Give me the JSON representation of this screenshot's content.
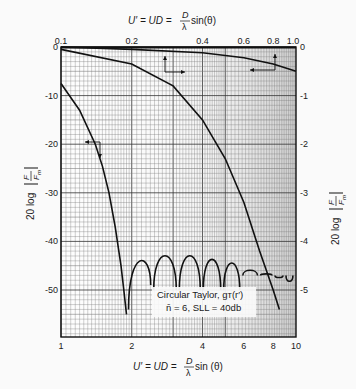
{
  "chart_data": {
    "type": "line",
    "title": "",
    "top_axis": {
      "label": "U' = UD = (D/λ) sin(θ)",
      "ticks": [
        "0.1",
        "0.2",
        "0.4",
        "0.6",
        "0.8",
        "1.0"
      ],
      "values": [
        0.1,
        0.2,
        0.4,
        0.6,
        0.8,
        1.0
      ],
      "scale": "log"
    },
    "bottom_axis": {
      "label": "U' = UD = (D/λ) sin (θ)",
      "ticks": [
        "1",
        "2",
        "4",
        "6",
        "8",
        "10"
      ],
      "values": [
        1,
        2,
        4,
        6,
        8,
        10
      ],
      "scale": "log"
    },
    "left_axis": {
      "label": "20 log |F/Fm|",
      "ticks": [
        "0",
        "-10",
        "-20",
        "-30",
        "-40",
        "-50"
      ],
      "values": [
        0,
        -10,
        -20,
        -30,
        -40,
        -50
      ],
      "ylim": [
        -55,
        0
      ]
    },
    "right_axis": {
      "label": "20 log |F/Fm|",
      "ticks": [
        "0",
        "-1",
        "-2",
        "-3",
        "-4",
        "-5"
      ],
      "values": [
        0,
        -1,
        -2,
        -3,
        -4,
        -5
      ],
      "ylim": [
        -5.5,
        0
      ]
    },
    "annotation": {
      "line1": "Circular Taylor, gT(r')",
      "line2": "n̄ = 6, SLL = 40db"
    },
    "series": [
      {
        "name": "Main pattern (bottom x, left y)",
        "x": [
          1.0,
          1.2,
          1.4,
          1.5,
          1.6,
          1.7,
          1.8,
          1.85,
          1.9
        ],
        "y": [
          -7.5,
          -13,
          -20,
          -24.5,
          -30,
          -37,
          -45,
          -50,
          -55
        ]
      },
      {
        "name": "Sidelobes (bottom x, left y)",
        "peaks_x": [
          2.15,
          2.75,
          3.55,
          4.4,
          5.3,
          6.4,
          7.5,
          8.5,
          9.3
        ],
        "peaks_y": [
          -42,
          -41,
          -41,
          -42,
          -43,
          -46,
          -47,
          -48,
          -49
        ]
      },
      {
        "name": "Main lobe detail (top x, right y)",
        "x": [
          0.1,
          0.2,
          0.3,
          0.4,
          0.5,
          0.6,
          0.7,
          0.8,
          0.85
        ],
        "y": [
          -0.05,
          -0.35,
          -0.8,
          -1.5,
          -2.3,
          -3.2,
          -4.2,
          -5.0,
          -5.4
        ]
      },
      {
        "name": "Main lobe near peak (top x, left y)",
        "x": [
          0.1,
          0.2,
          0.4,
          0.6,
          0.8,
          1.0
        ],
        "y": [
          0,
          -0.5,
          -1.2,
          -2.2,
          -3.5,
          -5.0
        ]
      }
    ],
    "grid": true
  },
  "labels": {
    "top_formula": "U′ = UD = ",
    "top_frac_num": "D",
    "top_frac_den": "λ",
    "top_tail": " sin(θ)",
    "bottom_formula": "U′ = UD = ",
    "bottom_frac_num": "D",
    "bottom_frac_den": "λ",
    "bottom_tail": " sin (θ)",
    "y_left": "20 log",
    "y_right": "20 log",
    "frac_F": "F",
    "frac_Fm": "F",
    "frac_sub": "m",
    "annot1": "Circular Taylor, gᴛ(r′)",
    "annot2": "n̄ = 6, SLL = 40db"
  }
}
